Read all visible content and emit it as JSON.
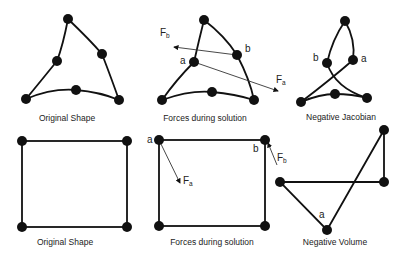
{
  "panels": {
    "tri_original": {
      "caption": "Original Shape"
    },
    "tri_forces": {
      "caption": "Forces during solution",
      "labels": {
        "a": "a",
        "b": "b",
        "fa": "F",
        "fa_sub": "a",
        "fb": "F",
        "fb_sub": "b"
      }
    },
    "tri_negative": {
      "caption": "Negative Jacobian",
      "labels": {
        "a": "a",
        "b": "b"
      }
    },
    "quad_original": {
      "caption": "Original Shape"
    },
    "quad_forces": {
      "caption": "Forces during solution",
      "labels": {
        "a": "a",
        "b": "b",
        "fa": "F",
        "fa_sub": "a",
        "fb": "F",
        "fb_sub": "b"
      }
    },
    "quad_negative": {
      "caption": "Negative Volume",
      "labels": {
        "a": "a"
      }
    }
  },
  "colors": {
    "ink": "#111111",
    "background": "#ffffff"
  }
}
